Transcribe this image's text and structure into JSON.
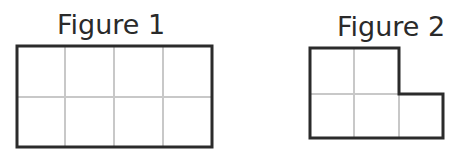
{
  "figures": [
    {
      "label": "Figure 1",
      "shape": "rectangle",
      "grid": {
        "columns": 4,
        "rows": 2
      },
      "unit_squares": 8
    },
    {
      "label": "Figure 2",
      "shape": "L-shape",
      "grid": {
        "columns": 3,
        "rows": 2
      },
      "unit_squares": 5
    }
  ],
  "colors": {
    "outline": "#2b2b2b",
    "grid_lines": "#c8c8c8",
    "background": "#ffffff"
  }
}
